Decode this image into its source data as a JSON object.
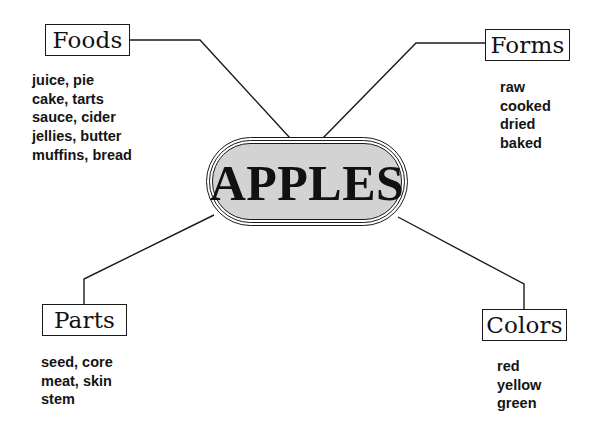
{
  "diagram": {
    "type": "concept-map",
    "center": {
      "label": "APPLES",
      "fill": "#d3d3d3"
    },
    "branches": [
      {
        "id": "foods",
        "label": "Foods",
        "items": [
          "juice, pie",
          "cake, tarts",
          "sauce, cider",
          "jellies, butter",
          "muffins, bread"
        ]
      },
      {
        "id": "forms",
        "label": "Forms",
        "items": [
          "raw",
          "cooked",
          "dried",
          "baked"
        ]
      },
      {
        "id": "parts",
        "label": "Parts",
        "items": [
          "seed, core",
          "meat, skin",
          "stem"
        ]
      },
      {
        "id": "colors",
        "label": "Colors",
        "items": [
          "red",
          "yellow",
          "green"
        ]
      }
    ]
  }
}
